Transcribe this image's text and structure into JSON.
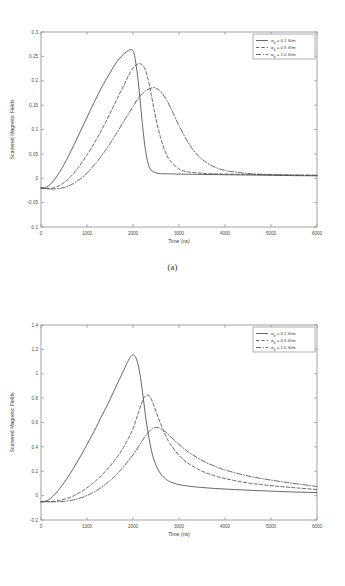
{
  "document": {
    "kind": "two-panel-figure"
  },
  "figures": [
    {
      "id": "a",
      "caption": "(a)",
      "chart_data": {
        "type": "line",
        "title": "",
        "xlabel": "Time (ns)",
        "ylabel": "Scattered Magnetic Fields",
        "xlim": [
          0,
          6000
        ],
        "ylim": [
          -0.1,
          0.3
        ],
        "xticks": [
          0,
          1000,
          2000,
          3000,
          4000,
          5000,
          6000
        ],
        "xticklabels": [
          "0",
          "1000",
          "2000",
          "3000",
          "4000",
          "5000",
          "6000"
        ],
        "yticks": [
          -0.1,
          -0.05,
          0,
          0.05,
          0.1,
          0.15,
          0.2,
          0.25,
          0.3
        ],
        "yticklabels": [
          "-0.1",
          "-0.05",
          "0",
          "0.05",
          "0.1",
          "0.15",
          "0.2",
          "0.25",
          "0.3"
        ],
        "grid": false,
        "legend_position": "upper right",
        "series": [
          {
            "name": "sigma_b = 0.1 S/m",
            "legend_base": "σ",
            "legend_subscript": "b",
            "legend_rest": " = 0.1 S/m",
            "style": "solid",
            "x": [
              0,
              100,
              200,
              300,
              400,
              500,
              600,
              700,
              800,
              900,
              1000,
              1100,
              1200,
              1300,
              1400,
              1500,
              1600,
              1700,
              1800,
              1900,
              1950,
              2000,
              2020,
              2050,
              2100,
              2150,
              2200,
              2250,
              2300,
              2350,
              2400,
              2500,
              2600,
              2800,
              3000,
              3400,
              3800,
              4200,
              4600,
              5000,
              5400,
              6000
            ],
            "y": [
              -0.02,
              -0.019,
              -0.013,
              -0.002,
              0.012,
              0.028,
              0.046,
              0.065,
              0.085,
              0.105,
              0.125,
              0.145,
              0.164,
              0.183,
              0.2,
              0.216,
              0.232,
              0.245,
              0.255,
              0.262,
              0.264,
              0.262,
              0.257,
              0.243,
              0.21,
              0.165,
              0.115,
              0.072,
              0.042,
              0.024,
              0.016,
              0.011,
              0.0095,
              0.009,
              0.0085,
              0.008,
              0.0075,
              0.007,
              0.0065,
              0.006,
              0.0055,
              0.005
            ]
          },
          {
            "name": "sigma_b = 0.5 S/m",
            "legend_base": "σ",
            "legend_subscript": "b",
            "legend_rest": " = 0.5 S/m",
            "style": "dashed",
            "x": [
              0,
              100,
              200,
              300,
              400,
              500,
              600,
              700,
              800,
              900,
              1000,
              1100,
              1200,
              1300,
              1400,
              1500,
              1600,
              1700,
              1800,
              1900,
              2000,
              2100,
              2150,
              2200,
              2250,
              2300,
              2350,
              2400,
              2500,
              2600,
              2700,
              2800,
              3000,
              3200,
              3400,
              3600,
              3800,
              4000,
              4400,
              4800,
              5200,
              5600,
              6000
            ],
            "y": [
              -0.02,
              -0.021,
              -0.021,
              -0.019,
              -0.015,
              -0.009,
              -0.001,
              0.009,
              0.021,
              0.034,
              0.048,
              0.063,
              0.079,
              0.096,
              0.114,
              0.133,
              0.152,
              0.172,
              0.19,
              0.21,
              0.226,
              0.234,
              0.235,
              0.233,
              0.226,
              0.213,
              0.194,
              0.17,
              0.122,
              0.083,
              0.055,
              0.037,
              0.019,
              0.013,
              0.011,
              0.0095,
              0.009,
              0.0085,
              0.008,
              0.0075,
              0.007,
              0.0065,
              0.006
            ]
          },
          {
            "name": "sigma_b = 1.0 S/m",
            "legend_base": "σ",
            "legend_subscript": "b",
            "legend_rest": " = 1.0 S/m",
            "style": "dashdot",
            "x": [
              0,
              100,
              200,
              300,
              400,
              500,
              600,
              700,
              800,
              900,
              1000,
              1100,
              1200,
              1300,
              1400,
              1500,
              1600,
              1700,
              1800,
              1900,
              2000,
              2100,
              2200,
              2300,
              2400,
              2450,
              2500,
              2550,
              2600,
              2700,
              2800,
              2900,
              3000,
              3200,
              3400,
              3600,
              3800,
              4000,
              4200,
              4600,
              5000,
              5400,
              6000
            ],
            "y": [
              -0.02,
              -0.021,
              -0.022,
              -0.022,
              -0.021,
              -0.019,
              -0.016,
              -0.011,
              -0.005,
              0.002,
              0.011,
              0.021,
              0.032,
              0.044,
              0.057,
              0.071,
              0.086,
              0.101,
              0.117,
              0.132,
              0.147,
              0.162,
              0.173,
              0.181,
              0.185,
              0.186,
              0.185,
              0.182,
              0.178,
              0.165,
              0.148,
              0.128,
              0.108,
              0.073,
              0.048,
              0.032,
              0.022,
              0.016,
              0.013,
              0.009,
              0.0075,
              0.0065,
              0.006
            ]
          }
        ]
      }
    },
    {
      "id": "b",
      "caption": "(b)",
      "chart_data": {
        "type": "line",
        "title": "",
        "xlabel": "Time (ns)",
        "ylabel": "Scattered Magnetic Fields",
        "xlim": [
          0,
          6000
        ],
        "ylim": [
          -0.2,
          1.4
        ],
        "xticks": [
          0,
          1000,
          2000,
          3000,
          4000,
          5000,
          6000
        ],
        "xticklabels": [
          "0",
          "1000",
          "2000",
          "3000",
          "4000",
          "5000",
          "6000"
        ],
        "yticks": [
          -0.2,
          0,
          0.2,
          0.4,
          0.6,
          0.8,
          1.0,
          1.2,
          1.4
        ],
        "yticklabels": [
          "-0.2",
          "0",
          "0.2",
          "0.4",
          "0.6",
          "0.8",
          "1",
          "1.2",
          "1.4"
        ],
        "grid": false,
        "legend_position": "upper right",
        "series": [
          {
            "name": "sigma_b = 0.1 S/m",
            "legend_base": "σ",
            "legend_subscript": "b",
            "legend_rest": " = 0.1 S/m",
            "style": "solid",
            "x": [
              0,
              100,
              200,
              300,
              400,
              500,
              600,
              700,
              800,
              900,
              1000,
              1100,
              1200,
              1300,
              1400,
              1500,
              1600,
              1700,
              1800,
              1900,
              1950,
              2000,
              2050,
              2100,
              2150,
              2200,
              2250,
              2300,
              2400,
              2500,
              2600,
              2700,
              2800,
              3000,
              3200,
              3400,
              3800,
              4200,
              4600,
              5000,
              5400,
              6000
            ],
            "y": [
              -0.05,
              -0.045,
              -0.025,
              0.01,
              0.055,
              0.105,
              0.16,
              0.22,
              0.285,
              0.35,
              0.42,
              0.49,
              0.56,
              0.64,
              0.71,
              0.79,
              0.87,
              0.95,
              1.03,
              1.11,
              1.14,
              1.155,
              1.14,
              1.09,
              1.0,
              0.87,
              0.72,
              0.58,
              0.37,
              0.25,
              0.18,
              0.14,
              0.115,
              0.09,
              0.078,
              0.07,
              0.058,
              0.05,
              0.043,
              0.037,
              0.031,
              0.025
            ]
          },
          {
            "name": "sigma_b = 0.5 S/m",
            "legend_base": "σ",
            "legend_subscript": "b",
            "legend_rest": " = 0.5 S/m",
            "style": "dashed",
            "x": [
              0,
              100,
              200,
              300,
              400,
              500,
              600,
              700,
              800,
              900,
              1000,
              1100,
              1200,
              1300,
              1400,
              1500,
              1600,
              1700,
              1800,
              1900,
              2000,
              2100,
              2200,
              2250,
              2300,
              2350,
              2400,
              2500,
              2600,
              2700,
              2800,
              3000,
              3200,
              3400,
              3600,
              3800,
              4000,
              4400,
              4800,
              5200,
              5600,
              6000
            ],
            "y": [
              -0.05,
              -0.05,
              -0.049,
              -0.045,
              -0.039,
              -0.03,
              -0.018,
              -0.003,
              0.016,
              0.038,
              0.064,
              0.093,
              0.125,
              0.16,
              0.2,
              0.243,
              0.29,
              0.34,
              0.4,
              0.47,
              0.55,
              0.66,
              0.77,
              0.81,
              0.825,
              0.82,
              0.79,
              0.69,
              0.59,
              0.5,
              0.43,
              0.33,
              0.265,
              0.22,
              0.185,
              0.16,
              0.14,
              0.11,
              0.09,
              0.075,
              0.062,
              0.05
            ]
          },
          {
            "name": "sigma_b = 1.0 S/m",
            "legend_base": "σ",
            "legend_subscript": "b",
            "legend_rest": " = 1.0 S/m",
            "style": "dashdot",
            "x": [
              0,
              100,
              200,
              300,
              400,
              500,
              600,
              700,
              800,
              900,
              1000,
              1100,
              1200,
              1300,
              1400,
              1500,
              1600,
              1700,
              1800,
              1900,
              2000,
              2100,
              2200,
              2300,
              2400,
              2450,
              2500,
              2550,
              2600,
              2700,
              2800,
              3000,
              3200,
              3400,
              3600,
              3800,
              4000,
              4400,
              4800,
              5200,
              5600,
              6000
            ],
            "y": [
              -0.05,
              -0.05,
              -0.051,
              -0.051,
              -0.05,
              -0.047,
              -0.042,
              -0.035,
              -0.026,
              -0.014,
              0.001,
              0.019,
              0.04,
              0.064,
              0.092,
              0.123,
              0.158,
              0.197,
              0.24,
              0.287,
              0.335,
              0.39,
              0.45,
              0.505,
              0.545,
              0.555,
              0.56,
              0.558,
              0.55,
              0.525,
              0.49,
              0.42,
              0.36,
              0.31,
              0.27,
              0.238,
              0.21,
              0.17,
              0.14,
              0.116,
              0.095,
              0.075
            ]
          }
        ]
      }
    }
  ]
}
